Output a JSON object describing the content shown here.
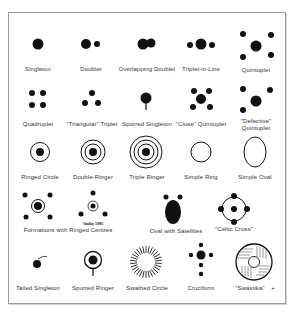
{
  "diagram": {
    "title": "",
    "colors": {
      "ink": "#111111",
      "label": "#333333",
      "border": "#9a9a9a",
      "background": "#ffffff"
    },
    "rows": [
      {
        "items": [
          {
            "label": "Singleton",
            "icon": "singleton-icon"
          },
          {
            "label": "Doublet",
            "icon": "doublet-icon"
          },
          {
            "label": "Overlapping Doublet",
            "icon": "overlapping-doublet-icon"
          },
          {
            "label": "Triplet-in-Line",
            "icon": "triplet-in-line-icon"
          },
          {
            "label": "Quintuplet",
            "icon": "quintuplet-icon"
          }
        ]
      },
      {
        "items": [
          {
            "label": "Quadruplet",
            "icon": "quadruplet-icon"
          },
          {
            "label": "\"Triangular\" Triplet",
            "icon": "triangular-triplet-icon"
          },
          {
            "label": "Spurred Singleton",
            "icon": "spurred-singleton-icon"
          },
          {
            "label": "\"Close\" Quintuplet",
            "icon": "close-quintuplet-icon"
          },
          {
            "label": "\"Defective\"",
            "label2": "Quintuplet",
            "icon": "defective-quintuplet-icon"
          }
        ]
      },
      {
        "items": [
          {
            "label": "Ringed Circle",
            "icon": "ringed-circle-icon"
          },
          {
            "label": "Double-Ringer",
            "icon": "double-ringer-icon"
          },
          {
            "label": "Triple Ringer",
            "icon": "triple-ringer-icon"
          },
          {
            "label": "Simple Ring",
            "icon": "simple-ring-icon"
          },
          {
            "label": "Simple Oval",
            "icon": "simple-oval-icon"
          }
        ]
      },
      {
        "items": [
          {
            "label": "Formations with Ringed Centres",
            "icon": "ringed-centre-formations-icon",
            "sublabel": "Gadby 1990"
          },
          {
            "label": "Oval with Satellites",
            "icon": "oval-with-satellites-icon"
          },
          {
            "label": "\"Celtic Cross\"",
            "icon": "celtic-cross-icon"
          }
        ]
      },
      {
        "items": [
          {
            "label": "Tailed Singleton",
            "icon": "tailed-singleton-icon"
          },
          {
            "label": "Spurred Ringer",
            "icon": "spurred-ringer-icon"
          },
          {
            "label": "Swathed Circle",
            "icon": "swathed-circle-icon"
          },
          {
            "label": "Cruciform",
            "icon": "cruciform-icon"
          },
          {
            "label": "\"Swastika\"",
            "icon": "swastika-icon",
            "marker": "+"
          }
        ]
      }
    ]
  }
}
